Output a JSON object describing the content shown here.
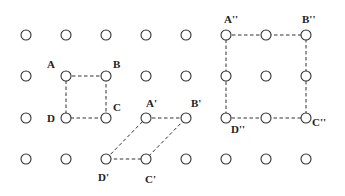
{
  "figure": {
    "grid": {
      "columns": [
        26,
        66,
        106,
        146,
        186,
        226,
        266,
        306
      ],
      "rows": [
        35,
        76,
        118,
        159
      ],
      "radius": 5
    },
    "shapes": [
      {
        "name": "ABCD",
        "vertices": [
          {
            "label": "A",
            "x": 66,
            "y": 76,
            "lx": 47,
            "ly": 68
          },
          {
            "label": "B",
            "x": 106,
            "y": 76,
            "lx": 113,
            "ly": 68
          },
          {
            "label": "C",
            "x": 106,
            "y": 118,
            "lx": 113,
            "ly": 111
          },
          {
            "label": "D",
            "x": 66,
            "y": 118,
            "lx": 47,
            "ly": 122
          }
        ]
      },
      {
        "name": "A'B'C'D'",
        "vertices": [
          {
            "label": "A'",
            "x": 146,
            "y": 118,
            "lx": 146,
            "ly": 107
          },
          {
            "label": "B'",
            "x": 186,
            "y": 118,
            "lx": 191,
            "ly": 107
          },
          {
            "label": "C'",
            "x": 146,
            "y": 159,
            "lx": 145,
            "ly": 183
          },
          {
            "label": "D'",
            "x": 106,
            "y": 159,
            "lx": 98,
            "ly": 181
          }
        ]
      },
      {
        "name": "A''B''C''D''",
        "vertices": [
          {
            "label": "A''",
            "x": 226,
            "y": 35,
            "lx": 224,
            "ly": 23
          },
          {
            "label": "B''",
            "x": 306,
            "y": 35,
            "lx": 302,
            "ly": 23
          },
          {
            "label": "C''",
            "x": 306,
            "y": 118,
            "lx": 312,
            "ly": 126
          },
          {
            "label": "D''",
            "x": 226,
            "y": 118,
            "lx": 231,
            "ly": 133
          }
        ]
      }
    ]
  }
}
